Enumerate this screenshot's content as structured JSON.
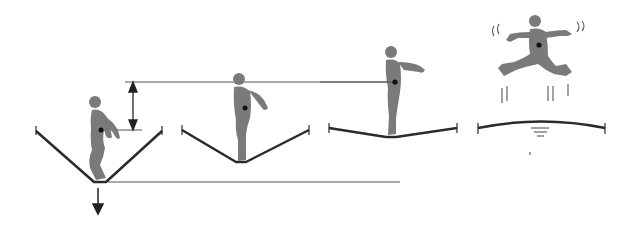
{
  "diagram": {
    "title": "",
    "colors": {
      "figure": "#7a7a7a",
      "mat": "#2b2b2b",
      "guide_line": "#555555",
      "com_dot": "#111111",
      "background": "#ffffff"
    },
    "stages": [
      {
        "id": "stage-1",
        "state": "maximum-compression",
        "mat_shape": "deep-v"
      },
      {
        "id": "stage-2",
        "state": "rebounding",
        "mat_shape": "shallow-v"
      },
      {
        "id": "stage-3",
        "state": "mat-nearly-flat",
        "mat_shape": "slight-v"
      },
      {
        "id": "stage-4",
        "state": "airborne",
        "mat_shape": "slight-arch"
      }
    ],
    "annotations": {
      "height_arrow": "double-headed vertical arrow showing rise of center of mass",
      "down_arrow": "downward force arrow below mat"
    }
  }
}
